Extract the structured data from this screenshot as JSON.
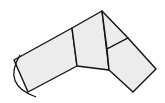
{
  "diagram": {
    "type": "geometric-figure",
    "colors": {
      "fill": "#ececec",
      "stroke": "#111111",
      "background": "#ffffff"
    },
    "shapes": {
      "left_arm": [
        [
          14,
          60
        ],
        [
          72,
          28
        ],
        [
          77,
          66
        ],
        [
          28,
          92
        ]
      ],
      "middle_block": [
        [
          72,
          28
        ],
        [
          102,
          11
        ],
        [
          109,
          70
        ],
        [
          77,
          66
        ]
      ],
      "right_triangle": [
        [
          102,
          11
        ],
        [
          128,
          38
        ],
        [
          107,
          49
        ]
      ],
      "right_block": [
        [
          107,
          49
        ],
        [
          128,
          38
        ],
        [
          156,
          69
        ],
        [
          133,
          92
        ],
        [
          109,
          70
        ]
      ]
    },
    "arc": {
      "from": [
        20,
        55
      ],
      "control": [
        2,
        85
      ],
      "to": [
        36,
        97
      ]
    }
  }
}
